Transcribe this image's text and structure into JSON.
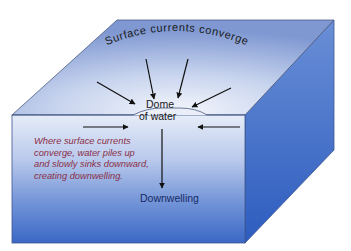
{
  "diagram": {
    "title_curved": "Surface currents converge",
    "dome_label_line1": "Dome",
    "dome_label_line2": "of water",
    "caption_lines": [
      "Where surface currents",
      "converge, water piles up",
      "and slowly sinks downward,",
      "creating downwelling."
    ],
    "bottom_label": "Downwelling",
    "arrows": {
      "surface_converging": 4,
      "subsurface_horizontal": 2,
      "downward": 1
    },
    "colors": {
      "top_face_light": "#e9eef8",
      "top_face_dark": "#8fa6d8",
      "front_face_top": "#dfe6f5",
      "front_face_bottom": "#3f6cc8",
      "side_face_top": "#5f86d2",
      "side_face_bottom": "#2f5fc0",
      "edge": "#4a5a80",
      "caption_text": "#8a3048",
      "downwelling_text": "#142a66",
      "arrow": "#111111"
    }
  }
}
